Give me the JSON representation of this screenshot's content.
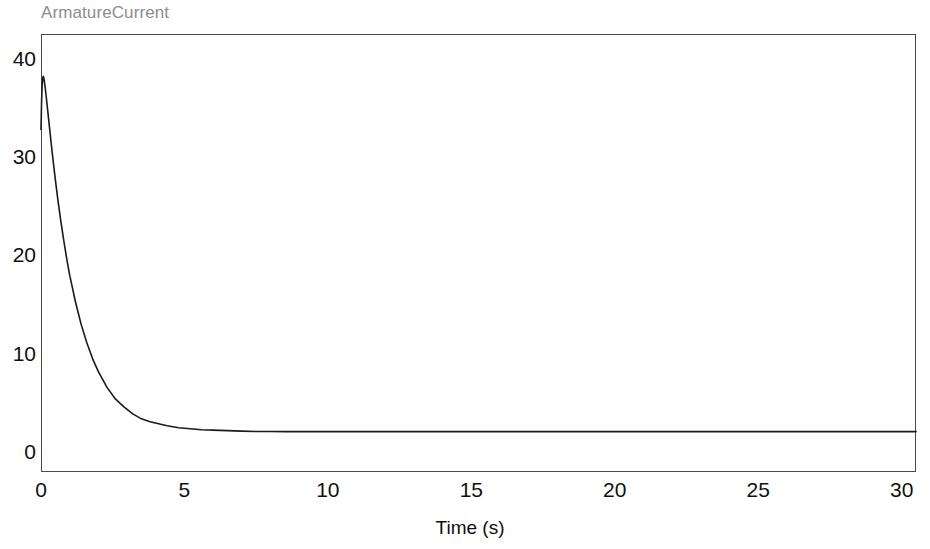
{
  "chart_data": {
    "type": "line",
    "title": "ArmatureCurrent",
    "xlabel": "Time (s)",
    "ylabel": "",
    "xlim": [
      0,
      30.5
    ],
    "ylim": [
      -2.0,
      42.5
    ],
    "xticks": [
      "0",
      "5",
      "10",
      "15",
      "20",
      "25",
      "30"
    ],
    "xtick_values": [
      0,
      5,
      10,
      15,
      20,
      25,
      30
    ],
    "yticks": [
      "0",
      "10",
      "20",
      "30",
      "40"
    ],
    "ytick_values": [
      0,
      10,
      20,
      30,
      40
    ],
    "grid": false,
    "legend": false,
    "line_color": "#1a1a1a",
    "series": [
      {
        "name": "ArmatureCurrent",
        "x": [
          0.0,
          0.02,
          0.04,
          0.06,
          0.08,
          0.1,
          0.14,
          0.18,
          0.22,
          0.26,
          0.3,
          0.4,
          0.5,
          0.6,
          0.7,
          0.8,
          0.9,
          1.0,
          1.2,
          1.4,
          1.6,
          1.8,
          2.0,
          2.3,
          2.6,
          2.9,
          3.2,
          3.5,
          3.8,
          4.1,
          4.4,
          4.8,
          5.2,
          5.6,
          6.0,
          6.5,
          7.0,
          7.5,
          8.0,
          8.5,
          9.0,
          10.0,
          11.0,
          12.0,
          14.0,
          16.0,
          18.0,
          20.0,
          22.0,
          24.0,
          26.0,
          28.0,
          30.0,
          30.5
        ],
        "y": [
          32.8,
          35.6,
          37.3,
          38.0,
          38.2,
          38.0,
          37.2,
          36.2,
          35.1,
          34.0,
          32.9,
          30.2,
          27.7,
          25.4,
          23.3,
          21.4,
          19.6,
          18.0,
          15.3,
          13.0,
          11.1,
          9.5,
          8.2,
          6.6,
          5.4,
          4.6,
          3.9,
          3.4,
          3.1,
          2.9,
          2.7,
          2.5,
          2.4,
          2.3,
          2.25,
          2.2,
          2.15,
          2.12,
          2.11,
          2.1,
          2.1,
          2.1,
          2.1,
          2.1,
          2.1,
          2.1,
          2.1,
          2.1,
          2.1,
          2.1,
          2.1,
          2.1,
          2.1,
          2.1
        ],
        "peak_value": 38.2,
        "peak_time": 0.08,
        "steady_state_value": 2.1
      }
    ]
  },
  "figure": {
    "title": "ArmatureCurrent",
    "axis": {
      "x_label": "Time (s)",
      "x_tick_labels": [
        "0",
        "5",
        "10",
        "15",
        "20",
        "25",
        "30"
      ],
      "y_tick_labels": [
        "0",
        "10",
        "20",
        "30",
        "40"
      ]
    }
  }
}
